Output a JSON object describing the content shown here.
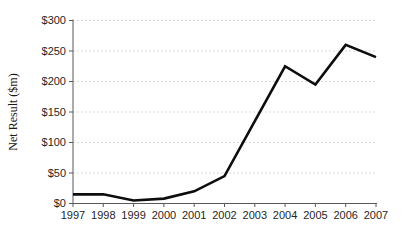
{
  "chart_data": {
    "type": "line",
    "title": "",
    "xlabel": "",
    "ylabel": "Net Result ($m)",
    "categories": [
      "1997",
      "1998",
      "1999",
      "2000",
      "2001",
      "2002",
      "2003",
      "2004",
      "2005",
      "2006",
      "2007"
    ],
    "series": [
      {
        "name": "Net Result",
        "values": [
          15,
          15,
          5,
          8,
          20,
          45,
          135,
          225,
          195,
          260,
          240
        ]
      }
    ],
    "ylim": [
      0,
      300
    ],
    "y_tick_step": 50,
    "y_tick_labels": [
      "$0",
      "$50",
      "$100",
      "$150",
      "$200",
      "$250",
      "$300"
    ],
    "grid": "horizontal-dashed",
    "legend": "none",
    "colors": {
      "line": "#0d0d0d",
      "gridline": "#d9d9d9",
      "axis": "#595959",
      "tick_text": "#262626",
      "background": "#ffffff"
    }
  }
}
